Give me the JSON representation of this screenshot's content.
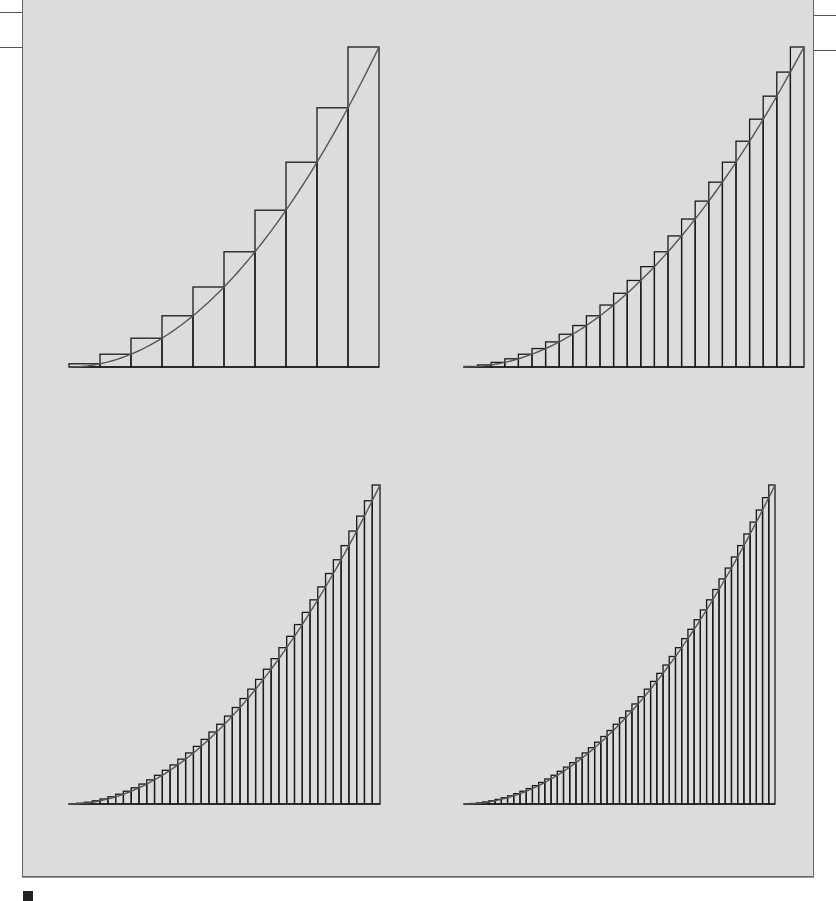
{
  "figure": {
    "background": "#dcdcdc",
    "stroke": "#1a1a1a",
    "curve_color": "#555555"
  },
  "chart_data": [
    {
      "type": "bar",
      "title": "",
      "function": "y = x^2",
      "method": "right-endpoint Riemann sum",
      "n": 10,
      "x_range": [
        0,
        1
      ],
      "values": [
        0.01,
        0.04,
        0.09,
        0.16,
        0.25,
        0.36,
        0.49,
        0.64,
        0.81,
        1.0
      ],
      "grid": false
    },
    {
      "type": "bar",
      "title": "",
      "function": "y = x^2",
      "method": "right-endpoint Riemann sum",
      "n": 25,
      "x_range": [
        0,
        1
      ],
      "grid": false
    },
    {
      "type": "bar",
      "title": "",
      "function": "y = x^2",
      "method": "right-endpoint Riemann sum",
      "n": 40,
      "x_range": [
        0,
        1
      ],
      "grid": false
    },
    {
      "type": "bar",
      "title": "",
      "function": "y = x^2",
      "method": "right-endpoint Riemann sum",
      "n": 50,
      "x_range": [
        0,
        1
      ],
      "grid": false
    }
  ],
  "panels": [
    {
      "left": 67,
      "top": 46,
      "width": 310,
      "height": 320
    },
    {
      "left": 462,
      "top": 46,
      "width": 340,
      "height": 320
    },
    {
      "left": 67,
      "top": 484,
      "width": 311,
      "height": 319
    },
    {
      "left": 462,
      "top": 484,
      "width": 311,
      "height": 319
    }
  ]
}
